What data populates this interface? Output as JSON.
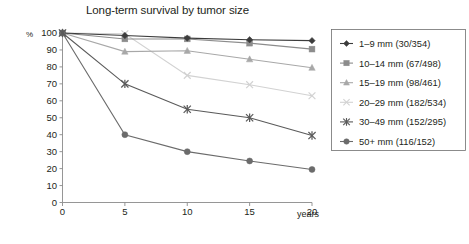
{
  "chart_data": {
    "type": "line",
    "title": "Long-term survival by tumor size",
    "xlabel": "years",
    "ylabel": "%",
    "x": [
      0,
      5,
      10,
      15,
      20
    ],
    "xlim": [
      0,
      20
    ],
    "ylim": [
      0,
      100
    ],
    "xticks": [
      "0",
      "5",
      "10",
      "15",
      "20"
    ],
    "yticks": [
      "0",
      "10",
      "20",
      "30",
      "40",
      "50",
      "60",
      "70",
      "80",
      "90",
      "100"
    ],
    "grid": false,
    "legend_position": "right",
    "series": [
      {
        "name": "1–9 mm (30/354)",
        "values": [
          100,
          98.5,
          97,
          96,
          95.5
        ],
        "color": "#3c3c3c",
        "marker": "diamond"
      },
      {
        "name": "10–14 mm (67/498)",
        "values": [
          100,
          96.5,
          96.5,
          94,
          90.5
        ],
        "color": "#8c8c8c",
        "marker": "square"
      },
      {
        "name": "15–19 mm (98/461)",
        "values": [
          100,
          89,
          89.5,
          84.5,
          79.5
        ],
        "color": "#a8a8a8",
        "marker": "triangle"
      },
      {
        "name": "20–29 mm (182/534)",
        "values": [
          100,
          99.5,
          75,
          69.5,
          63
        ],
        "color": "#d2d2d2",
        "marker": "cross"
      },
      {
        "name": "30–49 mm (152/295)",
        "values": [
          100,
          70,
          55,
          50,
          39.5
        ],
        "color": "#5a5a5a",
        "marker": "asterisk"
      },
      {
        "name": "50+ mm (116/152)",
        "values": [
          100,
          40,
          30,
          24.5,
          19.5
        ],
        "color": "#6b6b6b",
        "marker": "circle"
      }
    ]
  },
  "legend": {
    "entries": [
      "1–9 mm (30/354)",
      "10–14 mm (67/498)",
      "15–19 mm (98/461)",
      "20–29 mm (182/534)",
      "30–49 mm (152/295)",
      "50+ mm (116/152)"
    ]
  },
  "axes": {
    "y_unit": "%",
    "x_unit": "years",
    "y_tick_labels": [
      "100",
      "90",
      "80",
      "70",
      "60",
      "50",
      "40",
      "30",
      "20",
      "10",
      "0"
    ],
    "x_tick_labels": [
      "0",
      "5",
      "10",
      "15",
      "20"
    ]
  }
}
